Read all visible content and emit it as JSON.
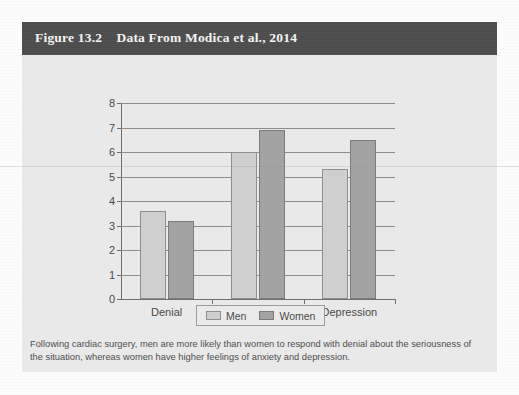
{
  "figure": {
    "header_label": "Figure 13.2",
    "header_title": "Data From Modica et al., 2014",
    "header_full": "Figure 13.2    Data From Modica et al., 2014",
    "caption": "Following cardiac surgery, men are more likely than women to respond with denial about the seriousness of the situation, whereas women have higher feelings of anxiety and depression.",
    "colors": {
      "header_bg": "#4c4c4c",
      "header_text": "#f2f2f2",
      "card_bg": "#e9e9e9",
      "men_bar": "#cfcfcf",
      "women_bar": "#a3a3a3",
      "gridline": "#8d8d8d",
      "axis": "#6e6e6e"
    }
  },
  "chart_data": {
    "type": "bar",
    "title": "Data From Modica et al., 2014",
    "xlabel": "",
    "ylabel": "",
    "categories": [
      "Denial",
      "Anxiety",
      "Depression"
    ],
    "series": [
      {
        "name": "Men",
        "values": [
          3.6,
          6.0,
          5.3
        ],
        "color": "#cfcfcf"
      },
      {
        "name": "Women",
        "values": [
          3.2,
          6.9,
          6.5
        ],
        "color": "#a3a3a3"
      }
    ],
    "ylim": [
      0,
      8
    ],
    "yticks": [
      0,
      1,
      2,
      3,
      4,
      5,
      6,
      7,
      8
    ],
    "ytick_labels": [
      "0",
      "1",
      "2",
      "3",
      "4",
      "5",
      "6",
      "7",
      "8"
    ],
    "grid": true,
    "legend": {
      "position": "bottom",
      "entries": [
        "Men",
        "Women"
      ]
    }
  }
}
